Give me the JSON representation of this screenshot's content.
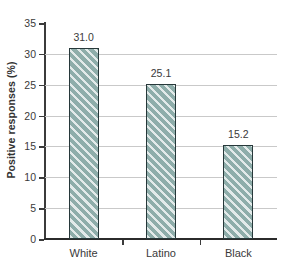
{
  "chart_data": {
    "type": "bar",
    "title": "",
    "xlabel": "",
    "ylabel": "Positive responses (%)",
    "categories": [
      "White",
      "Latino",
      "Black"
    ],
    "values": [
      31.0,
      25.1,
      15.2
    ],
    "value_labels": [
      "31.0",
      "25.1",
      "15.2"
    ],
    "ylim": [
      0,
      35
    ],
    "ytick_step": 5,
    "ytick_labels": [
      "0",
      "5",
      "10",
      "15",
      "20",
      "25",
      "30",
      "35"
    ],
    "ytick_values": [
      0,
      5,
      10,
      15,
      20,
      25,
      30,
      35
    ],
    "grid": "horizontal",
    "legend": "none",
    "bar_fill_color": "#8eadaa",
    "bar_hatch": "diagonal-forward-slash",
    "bar_edge_color": "#27383a",
    "gridline_color": "#c9c9c9",
    "axis_color": "#3b3b3b",
    "text_color": "#3a3a3a",
    "background_color": "#ffffff"
  }
}
